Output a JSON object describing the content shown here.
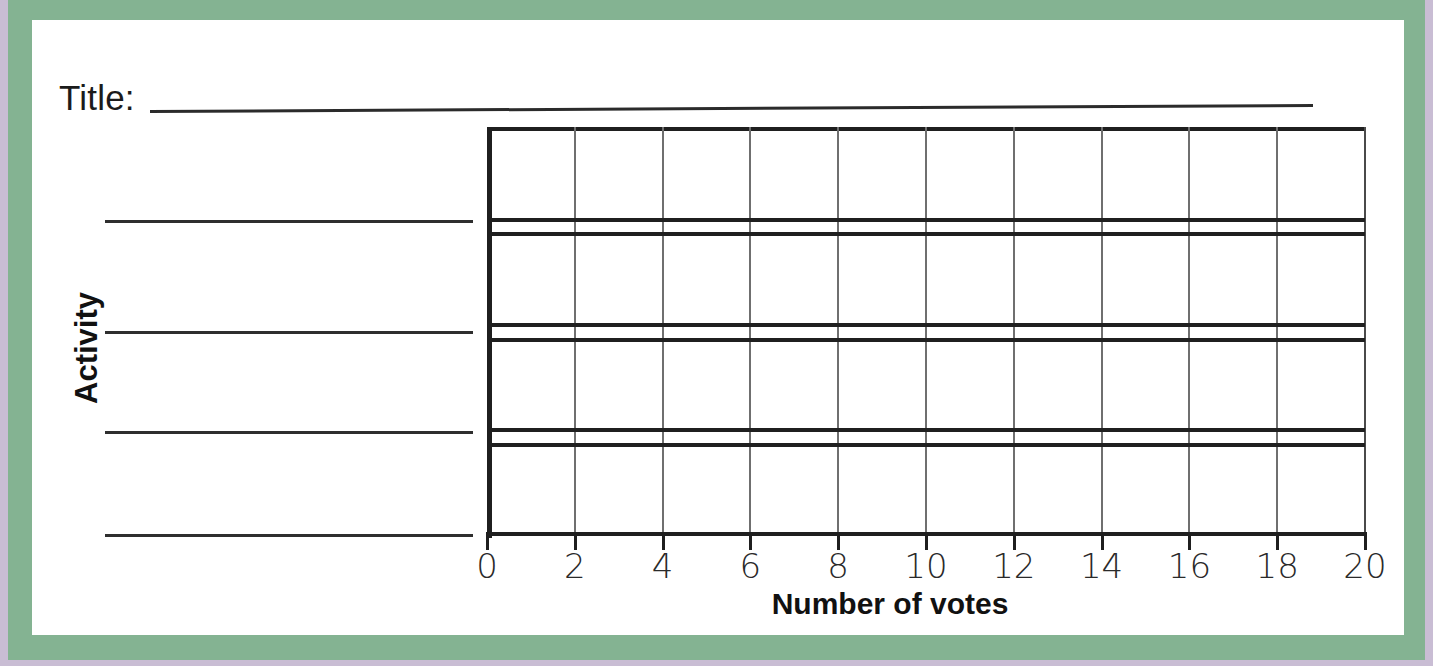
{
  "worksheet": {
    "title_label": "Title:",
    "title_value": ""
  },
  "axes": {
    "y_axis_label": "Activity",
    "x_axis_label": "Number of votes"
  },
  "category_lines": [
    {
      "name": "category-line-1",
      "value": ""
    },
    {
      "name": "category-line-2",
      "value": ""
    },
    {
      "name": "category-line-3",
      "value": ""
    },
    {
      "name": "category-line-4",
      "value": ""
    }
  ],
  "colors": {
    "outer_border": "#c9bdd4",
    "inner_border": "#84b392",
    "page": "#ffffff",
    "ink": "#1f1f1f",
    "gridline": "#6f6f6f"
  },
  "chart_data": {
    "type": "bar",
    "title": "",
    "xlabel": "Number of votes",
    "ylabel": "Activity",
    "orientation": "horizontal",
    "grid": true,
    "legend": null,
    "xlim": [
      0,
      20
    ],
    "xticks": [
      0,
      2,
      4,
      6,
      8,
      10,
      12,
      14,
      16,
      18,
      20
    ],
    "xtick_labels": [
      "0",
      "2",
      "4",
      "6",
      "8",
      "10",
      "12",
      "14",
      "16",
      "18",
      "20"
    ],
    "x_minor_step": 2,
    "categories": [
      "",
      "",
      "",
      ""
    ],
    "values": [
      0,
      0,
      0,
      0
    ],
    "note": "Blank bar-graph worksheet template: no data plotted; bar tracks and category labels left empty for the student to fill in."
  }
}
